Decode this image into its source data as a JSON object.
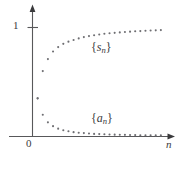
{
  "figure": {
    "title": "",
    "background_color": "#ffffff",
    "line_color": "#58585a",
    "dot_color": "#6e6e72",
    "text_color": "#3a3a3c"
  },
  "axes": {
    "y_axis_tick_label": "1",
    "origin_label": "0",
    "x_axis_label": "n",
    "x_axis_arrow": "arrow-right",
    "y_axis_arrow": "arrow-up"
  },
  "annotations": {
    "upper_series_brace_open": "{",
    "upper_series_symbol": "s",
    "upper_series_subscript": "n",
    "upper_series_brace_close": "}",
    "lower_series_brace_open": "{",
    "lower_series_symbol": "a",
    "lower_series_subscript": "n",
    "lower_series_brace_close": "}"
  },
  "chart_data": {
    "type": "scatter",
    "title": "",
    "xlabel": "n",
    "ylabel": "",
    "xlim": [
      0,
      26
    ],
    "ylim": [
      0,
      1.18
    ],
    "grid": false,
    "legend_position": "inline-annotation",
    "yticks": [
      1
    ],
    "ytick_labels": [
      "1"
    ],
    "xticks": [],
    "xtick_labels": [],
    "series": [
      {
        "name": "{s_n}",
        "label_text": "{s_n}",
        "marker": "dot",
        "x": [
          1,
          2,
          3,
          4,
          5,
          6,
          7,
          8,
          9,
          10,
          11,
          12,
          13,
          14,
          15,
          16,
          17,
          18,
          19,
          20,
          21,
          22,
          23,
          24,
          25
        ],
        "values": [
          0.35,
          0.6,
          0.71,
          0.78,
          0.82,
          0.85,
          0.87,
          0.885,
          0.9,
          0.912,
          0.921,
          0.929,
          0.936,
          0.942,
          0.947,
          0.951,
          0.955,
          0.959,
          0.962,
          0.965,
          0.967,
          0.97,
          0.972,
          0.974,
          0.976
        ]
      },
      {
        "name": "{a_n}",
        "label_text": "{a_n}",
        "marker": "dot",
        "x": [
          1,
          2,
          3,
          4,
          5,
          6,
          7,
          8,
          9,
          10,
          11,
          12,
          13,
          14,
          15,
          16,
          17,
          18,
          19,
          20,
          21,
          22,
          23,
          24,
          25
        ],
        "values": [
          0.35,
          0.2,
          0.13,
          0.095,
          0.072,
          0.058,
          0.048,
          0.04,
          0.035,
          0.031,
          0.027,
          0.024,
          0.022,
          0.02,
          0.018,
          0.017,
          0.016,
          0.015,
          0.014,
          0.013,
          0.012,
          0.011,
          0.011,
          0.01,
          0.01
        ]
      }
    ]
  }
}
